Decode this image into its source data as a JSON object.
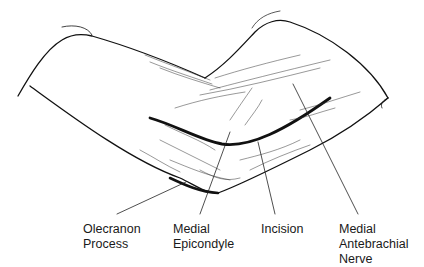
{
  "figure": {
    "labels": [
      {
        "id": "olecranon",
        "lines": [
          "Olecranon",
          "Process"
        ]
      },
      {
        "id": "epicondyle",
        "lines": [
          "Medial",
          "Epicondyle"
        ]
      },
      {
        "id": "incision",
        "lines": [
          "Incision"
        ]
      },
      {
        "id": "nerve",
        "lines": [
          "Medial",
          "Antebrachial",
          "Nerve"
        ]
      }
    ]
  },
  "colors": {
    "line": "#111111",
    "background": "#ffffff"
  }
}
